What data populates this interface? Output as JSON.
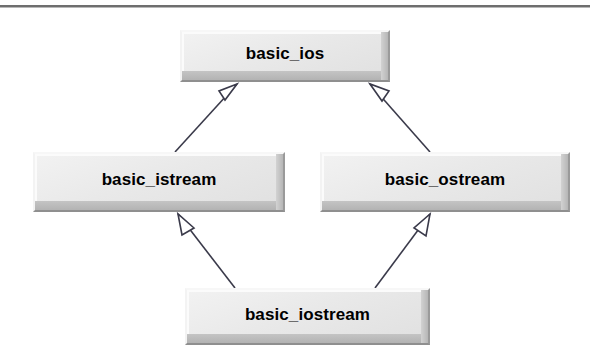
{
  "diagram": {
    "kind": "uml-class-inheritance",
    "colors": {
      "box_fill": "#e8e8e8",
      "box_highlight": "#f7f7f7",
      "box_shadow": "#8f8f8f",
      "line": "#3a3a4a",
      "text": "#000000",
      "rule": "#6e6e6e",
      "background": "#ffffff"
    },
    "top_rule": {
      "visible": true
    },
    "classes": [
      {
        "id": "basic_ios",
        "label": "basic_ios"
      },
      {
        "id": "basic_istream",
        "label": "basic_istream"
      },
      {
        "id": "basic_ostream",
        "label": "basic_ostream"
      },
      {
        "id": "basic_iostream",
        "label": "basic_iostream"
      }
    ],
    "relations": [
      {
        "type": "generalization",
        "from": "basic_istream",
        "to": "basic_ios",
        "arrow": "hollow-triangle"
      },
      {
        "type": "generalization",
        "from": "basic_ostream",
        "to": "basic_ios",
        "arrow": "hollow-triangle"
      },
      {
        "type": "generalization",
        "from": "basic_iostream",
        "to": "basic_istream",
        "arrow": "hollow-triangle"
      },
      {
        "type": "generalization",
        "from": "basic_iostream",
        "to": "basic_ostream",
        "arrow": "hollow-triangle"
      }
    ]
  }
}
